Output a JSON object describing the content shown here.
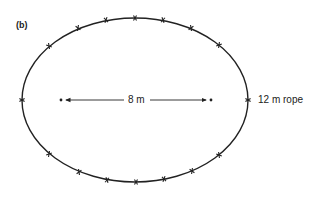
{
  "figure": {
    "panel_label": "(b)",
    "distance_label": "8 m",
    "rope_label": "12 m rope",
    "line_color": "#222222"
  },
  "ellipse": {
    "cx": 135,
    "cy": 100,
    "rx": 113,
    "ry": 82
  },
  "foci": [
    {
      "x": 61,
      "y": 100
    },
    {
      "x": 211,
      "y": 100
    }
  ],
  "ticks": [
    {
      "x": 22,
      "y": 100
    },
    {
      "x": 49,
      "y": 46
    },
    {
      "x": 78,
      "y": 28
    },
    {
      "x": 106,
      "y": 20
    },
    {
      "x": 135,
      "y": 18
    },
    {
      "x": 163,
      "y": 20
    },
    {
      "x": 191,
      "y": 28
    },
    {
      "x": 219,
      "y": 45
    },
    {
      "x": 248,
      "y": 100
    },
    {
      "x": 219,
      "y": 155
    },
    {
      "x": 192,
      "y": 171
    },
    {
      "x": 164,
      "y": 179
    },
    {
      "x": 136,
      "y": 182
    },
    {
      "x": 107,
      "y": 180
    },
    {
      "x": 79,
      "y": 172
    },
    {
      "x": 49,
      "y": 154
    }
  ]
}
